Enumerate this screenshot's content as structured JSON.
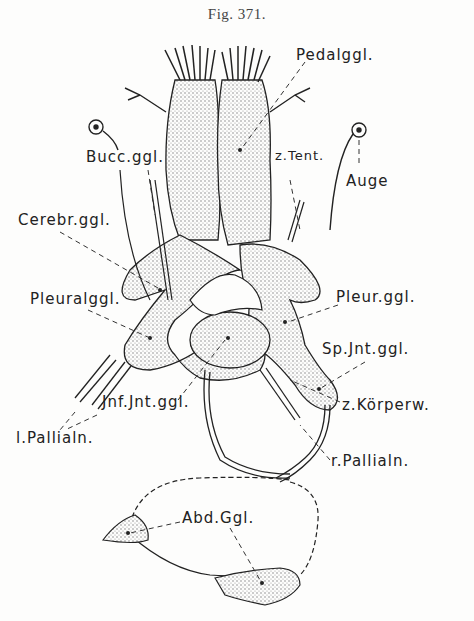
{
  "figure": {
    "title": "Fig. 371."
  },
  "labels": {
    "pedalggl": "Pedalggl.",
    "buccggl": "Bucc.ggl.",
    "ztent": "z.Tent.",
    "auge": "Auge",
    "cerebrggl": "Cerebr.ggl.",
    "pleuralggl": "Pleuralggl.",
    "pleurggl": "Pleur.ggl.",
    "spjntggl": "Sp.Jnt.ggl.",
    "jnfjntggl": "Jnf.Jnt.ggl.",
    "zkorperw": "z.Körperw.",
    "lpallialn": "l.Pallialn.",
    "rpallialn": "r.Pallialn.",
    "abdggl": "Abd.Ggl."
  },
  "colors": {
    "ink": "#222222",
    "stipple": "#8a8a8a",
    "paper": "#fdfdfc"
  }
}
